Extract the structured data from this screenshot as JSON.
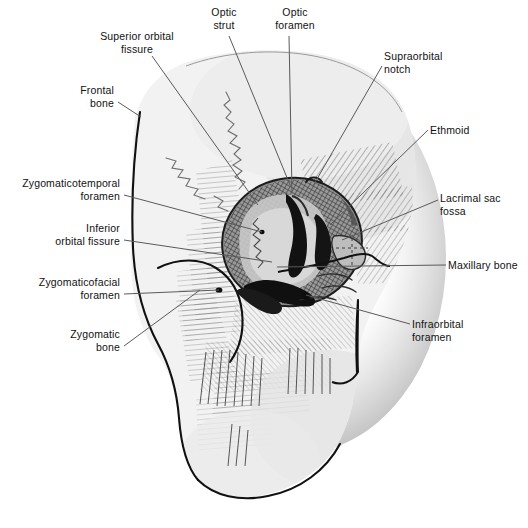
{
  "figure": {
    "background_color": "#ffffff",
    "ink_color": "#111111",
    "bone_fill": "#f1f1f1",
    "bone_shadow": "#d9d9d9",
    "orbit_dark": "#2a2a2a",
    "leader_color": "#5a5a5a"
  },
  "labels": [
    {
      "id": "superior-orbital-fissure",
      "text": "Superior orbital\nfissure",
      "align": "c",
      "x": 82,
      "y": 30,
      "w": 110,
      "leader": [
        [
          152,
          56
        ],
        [
          258,
          205
        ]
      ]
    },
    {
      "id": "optic-strut",
      "text": "Optic\nstrut",
      "align": "c",
      "x": 196,
      "y": 6,
      "w": 56,
      "leader": [
        [
          229,
          36
        ],
        [
          290,
          185
        ]
      ]
    },
    {
      "id": "optic-foramen",
      "text": "Optic\nforamen",
      "align": "c",
      "x": 262,
      "y": 6,
      "w": 66,
      "leader": [
        [
          289,
          36
        ],
        [
          292,
          193
        ]
      ]
    },
    {
      "id": "supraorbital-notch",
      "text": "Supraorbital\nnotch",
      "align": "l",
      "x": 384,
      "y": 50,
      "w": 86,
      "leader": [
        [
          382,
          66
        ],
        [
          313,
          186
        ]
      ]
    },
    {
      "id": "ethmoid",
      "text": "Ethmoid",
      "align": "l",
      "x": 430,
      "y": 124,
      "w": 62,
      "leader": [
        [
          428,
          130
        ],
        [
          330,
          225
        ]
      ]
    },
    {
      "id": "lacrimal-sac-fossa",
      "text": "Lacrimal sac\nfossa",
      "align": "l",
      "x": 440,
      "y": 192,
      "w": 84,
      "leader": [
        [
          438,
          200
        ],
        [
          342,
          240
        ]
      ]
    },
    {
      "id": "maxillary-bone",
      "text": "Maxillary bone",
      "align": "l",
      "x": 448,
      "y": 259,
      "w": 80,
      "leader": [
        [
          446,
          265
        ],
        [
          277,
          267
        ]
      ]
    },
    {
      "id": "infraorbital-foramen",
      "text": "Infraorbital\nforamen",
      "align": "l",
      "x": 412,
      "y": 318,
      "w": 84,
      "leader": [
        [
          410,
          324
        ],
        [
          306,
          295
        ]
      ]
    },
    {
      "id": "frontal-bone",
      "text": "Frontal\nbone",
      "align": "r",
      "x": 34,
      "y": 84,
      "w": 80,
      "leader": [
        [
          118,
          102
        ],
        [
          141,
          117
        ]
      ]
    },
    {
      "id": "zygomaticotemporal-foramen",
      "text": "Zygomaticotemporal\nforamen",
      "align": "r",
      "x": 8,
      "y": 177,
      "w": 112,
      "leader": [
        [
          124,
          195
        ],
        [
          262,
          232
        ]
      ]
    },
    {
      "id": "inferior-orbital-fissure",
      "text": "Inferior\norbital fissure",
      "align": "r",
      "x": 22,
      "y": 222,
      "w": 98,
      "leader": [
        [
          124,
          240
        ],
        [
          272,
          262
        ]
      ]
    },
    {
      "id": "zygomaticofacial-foramen",
      "text": "Zygomaticofacial\nforamen",
      "align": "r",
      "x": 18,
      "y": 276,
      "w": 102,
      "leader": [
        [
          124,
          294
        ],
        [
          219,
          290
        ]
      ]
    },
    {
      "id": "zygomatic-bone",
      "text": "Zygomatic\nbone",
      "align": "r",
      "x": 46,
      "y": 328,
      "w": 74,
      "leader": [
        [
          124,
          346
        ],
        [
          200,
          290
        ]
      ]
    }
  ]
}
